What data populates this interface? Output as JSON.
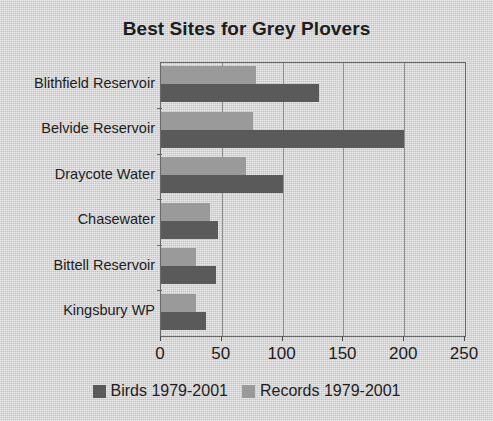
{
  "chart_data": {
    "type": "bar",
    "orientation": "horizontal",
    "title": "Best Sites for Grey Plovers",
    "xlabel": "",
    "ylabel": "",
    "categories": [
      "Blithfield Reservoir",
      "Belvide Reservoir",
      "Draycote Water",
      "Chasewater",
      "Bittell Reservoir",
      "Kingsbury WP"
    ],
    "series": [
      {
        "name": "Records 1979-2001",
        "color": "#9a9a9a",
        "values": [
          78,
          76,
          70,
          40,
          29,
          29
        ]
      },
      {
        "name": "Birds 1979-2001",
        "color": "#5a5a5a",
        "values": [
          130,
          200,
          100,
          47,
          45,
          37
        ]
      }
    ],
    "xlim": [
      0,
      250
    ],
    "xticks": [
      0,
      50,
      100,
      150,
      200,
      250
    ],
    "xtick_labels": [
      "0",
      "50",
      "100",
      "150",
      "200",
      "250"
    ],
    "grid": true,
    "grid_axis": "x",
    "legend": {
      "position": "bottom",
      "entries": [
        {
          "label": "Birds 1979-2001",
          "color": "#5a5a5a"
        },
        {
          "label": "Records 1979-2001",
          "color": "#9a9a9a"
        }
      ]
    },
    "colors": {
      "background": "#d4d4d4",
      "plot_border": "#6a6a6a",
      "gridline": "#8e8e8e",
      "text": "#1d1d1d"
    }
  }
}
